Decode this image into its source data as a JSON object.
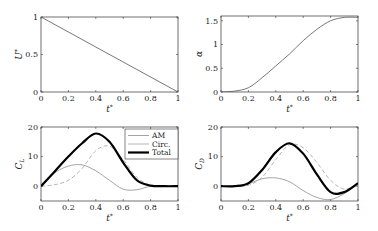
{
  "figure": {
    "panels": [
      {
        "id": "U",
        "ylabel": "U*",
        "ylabel_main": "U",
        "ylabel_sup": "*",
        "xlabel": "t*",
        "xticks": [
          "0",
          "0.2",
          "0.4",
          "0.6",
          "0.8",
          "1"
        ],
        "yticks": [
          "0",
          "0.5",
          "1"
        ]
      },
      {
        "id": "alpha",
        "ylabel": "α",
        "ylabel_main": "α",
        "ylabel_sup": "",
        "xlabel": "t*",
        "xticks": [
          "0",
          "0.2",
          "0.4",
          "0.6",
          "0.8",
          "1"
        ],
        "yticks": [
          "0",
          "0.5",
          "1",
          "1.5"
        ]
      },
      {
        "id": "CL",
        "ylabel": "C_L",
        "ylabel_main": "C",
        "ylabel_sub": "L",
        "xlabel": "t*",
        "xticks": [
          "0",
          "0.2",
          "0.4",
          "0.6",
          "0.8",
          "1"
        ],
        "yticks": [
          "0",
          "10",
          "20"
        ]
      },
      {
        "id": "CD",
        "ylabel": "C_D",
        "ylabel_main": "C",
        "ylabel_sub": "D",
        "xlabel": "t*",
        "xticks": [
          "0",
          "0.2",
          "0.4",
          "0.6",
          "0.8",
          "1"
        ],
        "yticks": [
          "0",
          "10",
          "20"
        ]
      }
    ],
    "legend": {
      "items": [
        {
          "label": "AM",
          "color": "#9a9a9a",
          "style": "solid-thin"
        },
        {
          "label": "Circ.",
          "color": "#b4b4b4",
          "style": "dashed"
        },
        {
          "label": "Total",
          "color": "#000000",
          "style": "solid-thick"
        }
      ]
    },
    "xlabel_main": "t",
    "xlabel_sup": "*"
  },
  "chart_data": [
    {
      "type": "line",
      "title": "",
      "xlabel": "t*",
      "ylabel": "U*",
      "xlim": [
        0,
        1
      ],
      "ylim": [
        0,
        1
      ],
      "grid": false,
      "x": [
        0,
        1
      ],
      "series": [
        {
          "name": "U*",
          "values": [
            1,
            0
          ]
        }
      ]
    },
    {
      "type": "line",
      "title": "",
      "xlabel": "t*",
      "ylabel": "α",
      "xlim": [
        0,
        1
      ],
      "ylim": [
        0,
        1.6
      ],
      "grid": false,
      "x": [
        0,
        0.1,
        0.2,
        0.3,
        0.4,
        0.5,
        0.6,
        0.7,
        0.8,
        0.9,
        1.0
      ],
      "series": [
        {
          "name": "α",
          "values": [
            0,
            0.02,
            0.09,
            0.3,
            0.55,
            0.8,
            1.08,
            1.32,
            1.5,
            1.57,
            1.57
          ]
        }
      ]
    },
    {
      "type": "line",
      "title": "",
      "xlabel": "t*",
      "ylabel": "C_L",
      "xlim": [
        0,
        1
      ],
      "ylim": [
        -5,
        20
      ],
      "grid": false,
      "legend_position": "upper right",
      "x": [
        0,
        0.1,
        0.2,
        0.3,
        0.4,
        0.5,
        0.6,
        0.7,
        0.8,
        0.9,
        1.0
      ],
      "series": [
        {
          "name": "AM",
          "values": [
            0,
            4.5,
            6.8,
            7.2,
            5.2,
            2,
            -1,
            -1.2,
            0,
            0,
            0
          ]
        },
        {
          "name": "Circ.",
          "values": [
            0,
            0.5,
            2,
            6,
            12,
            13.5,
            9,
            3,
            0.3,
            0,
            0
          ]
        },
        {
          "name": "Total",
          "values": [
            0,
            5,
            10,
            14.5,
            17.8,
            15,
            8,
            2,
            0.2,
            0,
            0
          ]
        }
      ]
    },
    {
      "type": "line",
      "title": "",
      "xlabel": "t*",
      "ylabel": "C_D",
      "xlim": [
        0,
        1
      ],
      "ylim": [
        -5,
        20
      ],
      "grid": false,
      "x": [
        0,
        0.1,
        0.2,
        0.3,
        0.4,
        0.5,
        0.6,
        0.7,
        0.8,
        0.9,
        1.0
      ],
      "series": [
        {
          "name": "AM",
          "values": [
            0,
            0,
            0.8,
            2.5,
            2.8,
            1.5,
            -1.5,
            -3.8,
            -4.5,
            -2.5,
            1
          ]
        },
        {
          "name": "Circ.",
          "values": [
            0,
            0,
            0.3,
            3,
            9,
            14,
            13,
            8,
            2,
            -1,
            0.5
          ]
        },
        {
          "name": "Total",
          "values": [
            0,
            0,
            1,
            5.5,
            11.5,
            14.5,
            11,
            4,
            -2,
            -2,
            1
          ]
        }
      ]
    }
  ]
}
